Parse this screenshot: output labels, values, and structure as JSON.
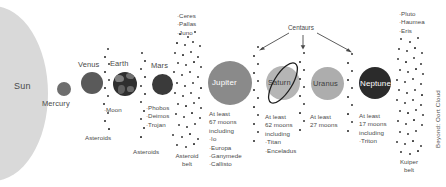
{
  "diagram": {
    "sun": {
      "label": "Sun"
    },
    "centaurs": {
      "label": "Centaurs"
    },
    "beyond": {
      "label": "Beyond: Oort Cloud"
    },
    "bodies": [
      {
        "name": "Sun",
        "label": "Sun"
      },
      {
        "name": "Mercury",
        "label": "Mercury"
      },
      {
        "name": "Venus",
        "label": "Venus"
      },
      {
        "name": "Earth",
        "label": "Earth"
      },
      {
        "name": "Mars",
        "label": "Mars"
      },
      {
        "name": "Jupiter",
        "label": "Jupiter"
      },
      {
        "name": "Saturn",
        "label": "Saturn"
      },
      {
        "name": "Uranus",
        "label": "Uranus"
      },
      {
        "name": "Neptune",
        "label": "Neptune"
      }
    ],
    "earth_moons": "·Moon",
    "mars_moons": "·Phobos\n·Deimos\n·Trojan",
    "asteroids_label_1": "Asteroids",
    "asteroids_label_2": "Asteroids",
    "asteroid_belt_label": "Asteroid\nbelt",
    "main_belt_objects": "·Ceres\n·Pallas\n·Juno",
    "jupiter_moons": "At least\n67 moons\nincluding\n·Io\n·Europa\n·Ganymede\n·Callisto",
    "saturn_moons": "At least\n62 moons\nincluding\n·Titan\n·Enceladus",
    "uranus_moons": "At least\n27 moons",
    "neptune_moons": "At least\n17 moons\nincluding\n·Triton",
    "kuiper_objects": "·Pluto\n·Haumea\n·Eris",
    "kuiper_belt_label": "Kuiper\nbelt",
    "colors": {
      "sun": "#d9d9d9",
      "mercury": "#6e6e6e",
      "venus": "#5a5a5a",
      "earth": "#2f2f2f",
      "mars": "#3a3a3a",
      "jupiter": "#8a8a8a",
      "saturn": "#b5b5b5",
      "uranus": "#adadad",
      "neptune": "#2b2b2b",
      "text": "#4a4a4a",
      "dots": "#3a3a3a",
      "background": "#ffffff"
    }
  }
}
